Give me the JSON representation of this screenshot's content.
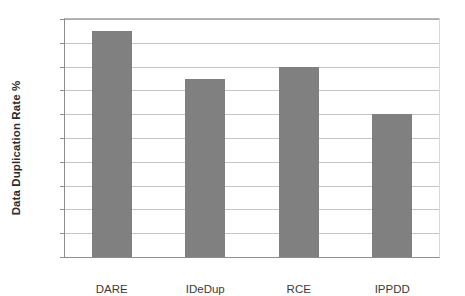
{
  "chart_data": {
    "type": "bar",
    "title": "",
    "categories": [
      "DARE",
      "IDeDup",
      "RCE",
      "IPPDD"
    ],
    "values": [
      19,
      15,
      16,
      12
    ],
    "series": [
      {
        "name": "Data Duplication Rate %",
        "values": [
          19,
          15,
          16,
          12
        ]
      }
    ],
    "xlabel": "",
    "ylabel": "Data Duplication Rate %",
    "ylim": [
      0,
      20
    ],
    "yticks": [
      0,
      2,
      4,
      6,
      8,
      10,
      12,
      14,
      16,
      18,
      20
    ],
    "ytick_labels": [
      "0",
      "2",
      "4",
      "6",
      "8",
      "10",
      "12",
      "14",
      "16",
      "18",
      "20"
    ],
    "grid": true,
    "grid_axis": "y",
    "legend": false,
    "legend_position": "none",
    "bar_color": "#808080",
    "background_color": "#ffffff",
    "gridline_color": "#c4c4c4",
    "axis_color": "#8c8c8c"
  }
}
